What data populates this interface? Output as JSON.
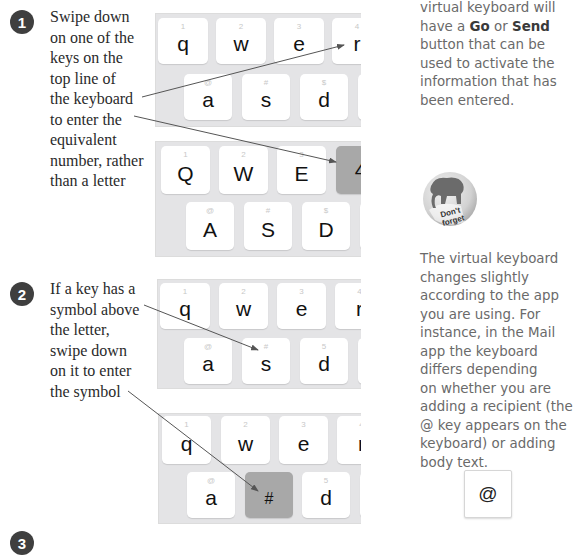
{
  "steps": [
    {
      "number": "1",
      "lines": [
        "Swipe down",
        "on one of the",
        "keys on the",
        "top line of",
        "the keyboard",
        "to enter the",
        "equivalent",
        "number, rather",
        "than a letter"
      ]
    },
    {
      "number": "2",
      "lines": [
        "If a key has a",
        "symbol above",
        "the letter,",
        "swipe down",
        "on it to enter",
        "the symbol"
      ]
    },
    {
      "number": "3"
    }
  ],
  "keyboards": [
    {
      "id": "step1-before",
      "row1": [
        {
          "sym": "1",
          "main": "q"
        },
        {
          "sym": "2",
          "main": "w"
        },
        {
          "sym": "3",
          "main": "e"
        },
        {
          "sym": "4",
          "main": "r"
        }
      ],
      "row2": [
        {
          "sym": "@",
          "main": "a"
        },
        {
          "sym": "#",
          "main": "s"
        },
        {
          "sym": "$",
          "main": "d"
        },
        {
          "sym": "&",
          "main": "f"
        }
      ]
    },
    {
      "id": "step1-after",
      "row1": [
        {
          "sym": "1",
          "main": "Q"
        },
        {
          "sym": "2",
          "main": "W"
        },
        {
          "sym": "3",
          "main": "E"
        },
        {
          "sym": "",
          "main": "4",
          "pressed": true
        }
      ],
      "row2": [
        {
          "sym": "@",
          "main": "A"
        },
        {
          "sym": "#",
          "main": "S"
        },
        {
          "sym": "$",
          "main": "D"
        },
        {
          "sym": "&",
          "main": "F"
        }
      ]
    },
    {
      "id": "step2-before",
      "row1": [
        {
          "sym": "1",
          "main": "q"
        },
        {
          "sym": "2",
          "main": "w"
        },
        {
          "sym": "3",
          "main": "e"
        },
        {
          "sym": "4",
          "main": "r"
        }
      ],
      "row2": [
        {
          "sym": "@",
          "main": "a"
        },
        {
          "sym": "#",
          "main": "s"
        },
        {
          "sym": "5",
          "main": "d"
        },
        {
          "sym": "6",
          "main": "f"
        }
      ]
    },
    {
      "id": "step2-after",
      "row1": [
        {
          "sym": "1",
          "main": "q"
        },
        {
          "sym": "2",
          "main": "w"
        },
        {
          "sym": "3",
          "main": "e"
        },
        {
          "sym": "4",
          "main": "r"
        }
      ],
      "row2": [
        {
          "sym": "@",
          "main": "a"
        },
        {
          "sym": "",
          "main": "#",
          "pressed": true
        },
        {
          "sym": "5",
          "main": "d"
        },
        {
          "sym": "6",
          "main": "f"
        }
      ]
    }
  ],
  "sidebar": {
    "top_lines": [
      "virtual keyboard will",
      "have a ",
      "button that can be",
      "used to activate the",
      "information that has",
      "been entered."
    ],
    "go_label": "Go",
    "or_label": " or ",
    "send_label": "Send",
    "badge_text_1": "Don't",
    "badge_text_2": "forget",
    "note_lines": [
      "The virtual keyboard",
      "changes slightly",
      "according to the app",
      "you are using. For",
      "instance, in the Mail",
      "app the keyboard",
      "differs depending",
      "on whether you are",
      "adding a recipient (the",
      "@ key appears on the",
      "keyboard) or adding",
      "body text."
    ],
    "at_key_label": "@"
  },
  "colors": {
    "step_badge": "#3f3f3f",
    "keyboard_bg": "#e4e4e6",
    "key_bg": "#ffffff",
    "pressed_key_bg": "#a8a8a8",
    "arrow": "#555555"
  }
}
